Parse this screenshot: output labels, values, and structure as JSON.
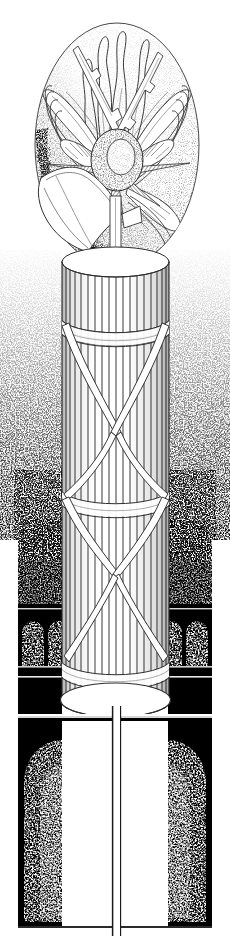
{
  "artwork": {
    "title": "Winged Sun Disk Above Fluted Column",
    "medium": "Pen and ink stipple engraving",
    "palette": {
      "ink": "#000000",
      "paper": "#ffffff",
      "line": "#1a1a1a",
      "mid_gray": "#808080",
      "light_gray": "#c8c8c8"
    },
    "canvas": {
      "width": 230,
      "height": 936
    }
  },
  "elements": {
    "oval_medallion": {
      "name": "Stippled oval field",
      "center_x": 117,
      "center_y": 145,
      "radius_x": 82,
      "radius_y": 123
    },
    "winged_emblem": {
      "name": "Winged sun disk with flames and thunderbolts",
      "wing_pairs": 2,
      "flame_tongues": 4,
      "thunderbolts": 2,
      "star_points": 6,
      "orb_center_x": 117,
      "orb_center_y": 158
    },
    "horn": {
      "name": "Trumpet bell horn",
      "position": "left-foreground",
      "tip_x": 122,
      "tip_y": 218
    },
    "column": {
      "name": "Fluted cylindrical column",
      "left": 62,
      "right": 169,
      "top": 250,
      "bottom": 712,
      "flute_count": 17,
      "bands": 3,
      "diagonal_straps": 4
    },
    "wall": {
      "name": "Dark stippled wall with arched niches",
      "top": 560,
      "rows": [
        {
          "label": "upper-row",
          "top": 612,
          "height": 56,
          "niches": 4
        },
        {
          "label": "lower-row",
          "top": 682,
          "height": 246,
          "niches": 2
        }
      ]
    },
    "pilaster": {
      "name": "Narrow vertical pilaster below column",
      "x": 116,
      "top": 706,
      "bottom": 936,
      "width": 8
    }
  }
}
